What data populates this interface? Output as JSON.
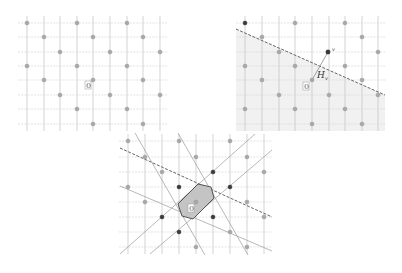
{
  "panels": [
    {
      "id": "lattice",
      "origin_label": "0"
    },
    {
      "id": "halfspace",
      "origin_label": "0",
      "point_label": "v",
      "hyperplane_label": "H",
      "hyperplane_subscript": "v"
    },
    {
      "id": "voronoi-cell",
      "origin_label": "0"
    }
  ],
  "colors": {
    "grid": "#c8c8c8",
    "lattice_point": "#a8a8a8",
    "highlight_point": "#3a3a3a",
    "voronoi_fill": "#c4c4c4",
    "halfspace_fill": "#f1f1f1"
  }
}
